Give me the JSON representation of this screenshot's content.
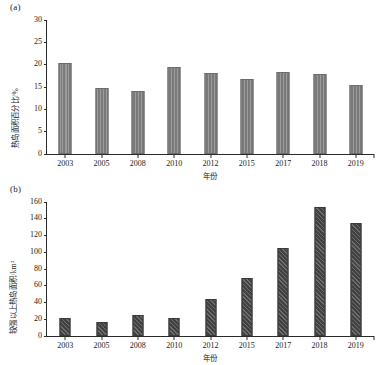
{
  "figure": {
    "background": "#ffffff",
    "panel_a_letter": "(a)",
    "panel_b_letter": "(b)"
  },
  "chart_data": [
    {
      "type": "bar",
      "panel": "(a)",
      "title": "",
      "xlabel": "年份",
      "ylabel": "热岛面积百分比/%",
      "categories": [
        "2003",
        "2005",
        "2008",
        "2010",
        "2012",
        "2015",
        "2017",
        "2018",
        "2019"
      ],
      "values": [
        20.4,
        14.7,
        14.1,
        19.5,
        18.1,
        16.9,
        18.3,
        17.9,
        15.5
      ],
      "ylim": [
        0,
        30
      ],
      "yticks": [
        0,
        5,
        10,
        15,
        20,
        25,
        30
      ],
      "ytick_labels": [
        "0",
        "5",
        "10",
        "15",
        "20",
        "25",
        "30"
      ],
      "grid": false,
      "legend": null,
      "bar_color": "#808080",
      "bar_edge_color": "#6d6d6d"
    },
    {
      "type": "bar",
      "panel": "(b)",
      "title": "",
      "xlabel": "年份",
      "ylabel": "较强以上热岛面积/km²",
      "categories": [
        "2003",
        "2005",
        "2008",
        "2010",
        "2012",
        "2015",
        "2017",
        "2018",
        "2019"
      ],
      "values": [
        21.5,
        16.5,
        25.0,
        21.5,
        44.0,
        69.0,
        105.0,
        154.0,
        135.0
      ],
      "ylim": [
        0,
        160
      ],
      "yticks": [
        0,
        20,
        40,
        60,
        80,
        100,
        120,
        140,
        160
      ],
      "ytick_labels": [
        "0",
        "20",
        "40",
        "60",
        "80",
        "100",
        "120",
        "140",
        "160"
      ],
      "grid": false,
      "legend": null,
      "bar_color": "#4a4a4a",
      "bar_edge_color": "#3a3a3a"
    }
  ]
}
